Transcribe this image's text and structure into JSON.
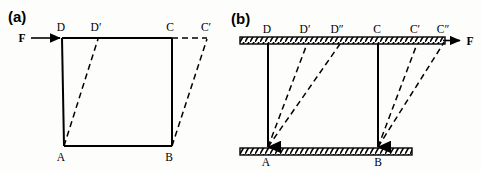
{
  "figure": {
    "background_color": "#fdfdfc",
    "line_color": "#000000",
    "panels": [
      {
        "tag": "(a)",
        "tag_x": 8,
        "tag_y": 22,
        "force_label": "F",
        "force_label_x": 22,
        "force_label_y": 42,
        "description": "Unconstrained square ABCD sheared by force F applied at top-left corner D; dashed outline shows sheared position with D moved to D prime and C moved to C prime.",
        "vertices": [
          {
            "name": "A",
            "x": 64,
            "y": 146,
            "label_x": 61,
            "label_y": 161
          },
          {
            "name": "B",
            "x": 172,
            "y": 146,
            "label_x": 169,
            "label_y": 161
          },
          {
            "name": "C",
            "x": 172,
            "y": 38,
            "label_x": 169,
            "label_y": 31
          },
          {
            "name": "D",
            "x": 62,
            "y": 38,
            "label_x": 59,
            "label_y": 31
          },
          {
            "name": "D′",
            "x": 98,
            "y": 39,
            "label_x": 90,
            "label_y": 31
          },
          {
            "name": "C′",
            "x": 207,
            "y": 39,
            "label_x": 200,
            "label_y": 31
          }
        ],
        "solid_edges": [
          {
            "from": "D",
            "to": "C"
          },
          {
            "from": "C",
            "to": "B"
          },
          {
            "from": "B",
            "to": "A"
          },
          {
            "from": "A",
            "to": "D"
          }
        ],
        "dashed_edges": [
          {
            "from": "A",
            "to": "D′"
          },
          {
            "from": "B",
            "to": "C′"
          },
          {
            "from": "C",
            "to": "C′"
          }
        ],
        "arrow": {
          "from_x": 31,
          "from_y": 38,
          "to_x": 62,
          "to_y": 38
        }
      },
      {
        "tag": "(b)",
        "tag_x": 231,
        "tag_y": 24,
        "force_label": "F",
        "force_label_x": 468,
        "force_label_y": 42,
        "description": "Square ABCD constrained between two rigid hatched plates; force F applied along the top plate shears the sheet successively to D prime / C prime and D double prime / C double prime.",
        "vertices": [
          {
            "name": "A",
            "x": 268,
            "y": 148,
            "label_x": 264,
            "label_y": 165
          },
          {
            "name": "B",
            "x": 378,
            "y": 148,
            "label_x": 374,
            "label_y": 165
          },
          {
            "name": "C",
            "x": 378,
            "y": 43,
            "label_x": 374,
            "label_y": 33
          },
          {
            "name": "D",
            "x": 268,
            "y": 43,
            "label_x": 264,
            "label_y": 33
          },
          {
            "name": "D′",
            "x": 307,
            "y": 43,
            "label_x": 299,
            "label_y": 33
          },
          {
            "name": "D″",
            "x": 340,
            "y": 43,
            "label_x": 330,
            "label_y": 33
          },
          {
            "name": "C′",
            "x": 417,
            "y": 43,
            "label_x": 409,
            "label_y": 33
          },
          {
            "name": "C″",
            "x": 443,
            "y": 43,
            "label_x": 436,
            "label_y": 33
          }
        ],
        "solid_edges": [
          {
            "from": "D",
            "to": "A"
          },
          {
            "from": "C",
            "to": "B"
          }
        ],
        "dashed_edges": [
          {
            "from": "A",
            "to": "D′"
          },
          {
            "from": "A",
            "to": "D″"
          },
          {
            "from": "B",
            "to": "C′"
          },
          {
            "from": "B",
            "to": "C″"
          }
        ],
        "plates": [
          {
            "name": "top-plate",
            "x": 240,
            "y": 37,
            "width": 205,
            "height": 7
          },
          {
            "name": "bottom-plate",
            "x": 240,
            "y": 148,
            "width": 172,
            "height": 7
          }
        ],
        "arrow": {
          "from_x": 443,
          "from_y": 40,
          "to_x": 462,
          "to_y": 40
        }
      }
    ]
  }
}
